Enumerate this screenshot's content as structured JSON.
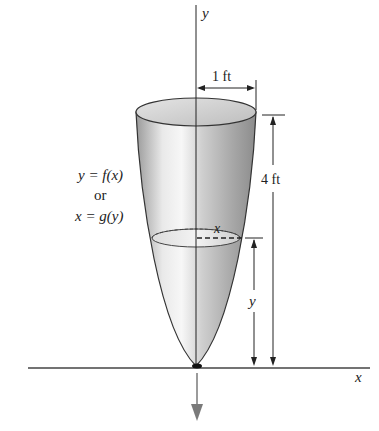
{
  "figure": {
    "type": "parabolic tank cross-section",
    "axes": {
      "x_label": "x",
      "y_label": "y"
    },
    "curve_label": {
      "line1": "y = f(x)",
      "line2": "or",
      "line3": "x = g(y)"
    },
    "dimensions": {
      "radius_label": "1 ft",
      "height_label": "4 ft",
      "level_label": "y",
      "slice_radius_label": "x"
    },
    "colors": {
      "line": "#222222",
      "shade_light": "#f2f2f2",
      "shade_dark": "#8a8a8a",
      "arrow_gray": "#7a7a7a"
    }
  }
}
